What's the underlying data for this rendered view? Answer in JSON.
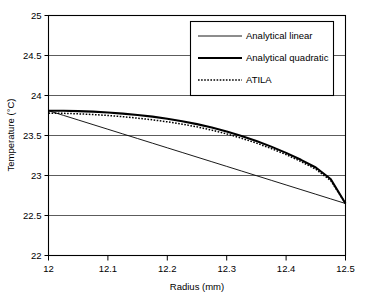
{
  "chart_data": {
    "type": "line",
    "title": "",
    "xlabel": "Radius (mm)",
    "ylabel": "Temperature (°C)",
    "xlim": [
      12,
      12.5
    ],
    "ylim": [
      22,
      25
    ],
    "xticks": [
      "12",
      "12.1",
      "12.2",
      "12.3",
      "12.4",
      "12.5"
    ],
    "xtick_values": [
      12,
      12.1,
      12.2,
      12.3,
      12.4,
      12.5
    ],
    "yticks": [
      "22",
      "22.5",
      "23",
      "23.5",
      "24",
      "24.5",
      "25"
    ],
    "ytick_values": [
      22,
      22.5,
      23,
      23.5,
      24,
      24.5,
      25
    ],
    "grid": "horizontal",
    "legend_position": "top-right",
    "x": [
      12.0,
      12.025,
      12.05,
      12.075,
      12.1,
      12.125,
      12.15,
      12.175,
      12.2,
      12.225,
      12.25,
      12.275,
      12.3,
      12.325,
      12.35,
      12.375,
      12.4,
      12.425,
      12.45,
      12.475,
      12.5
    ],
    "series": [
      {
        "name": "Analytical linear",
        "style": "thin-solid",
        "color": "#000000",
        "values": [
          23.81,
          23.752,
          23.694,
          23.636,
          23.578,
          23.52,
          23.462,
          23.404,
          23.346,
          23.288,
          23.23,
          23.172,
          23.114,
          23.056,
          22.998,
          22.94,
          22.882,
          22.824,
          22.766,
          22.708,
          22.65
        ]
      },
      {
        "name": "Analytical quadratic",
        "style": "thick-solid",
        "color": "#000000",
        "values": [
          23.81,
          23.809,
          23.805,
          23.798,
          23.788,
          23.774,
          23.757,
          23.736,
          23.71,
          23.679,
          23.642,
          23.599,
          23.55,
          23.494,
          23.431,
          23.361,
          23.283,
          23.196,
          23.1,
          22.956,
          22.65
        ]
      },
      {
        "name": "ATILA",
        "style": "dotted",
        "color": "#000000",
        "values": [
          23.78,
          23.777,
          23.771,
          23.762,
          23.75,
          23.735,
          23.717,
          23.696,
          23.671,
          23.642,
          23.608,
          23.567,
          23.52,
          23.466,
          23.405,
          23.337,
          23.261,
          23.175,
          23.078,
          22.938,
          22.65
        ]
      }
    ]
  },
  "legend": {
    "items": [
      {
        "label": "Analytical linear"
      },
      {
        "label": "Analytical quadratic"
      },
      {
        "label": "ATILA"
      }
    ]
  }
}
